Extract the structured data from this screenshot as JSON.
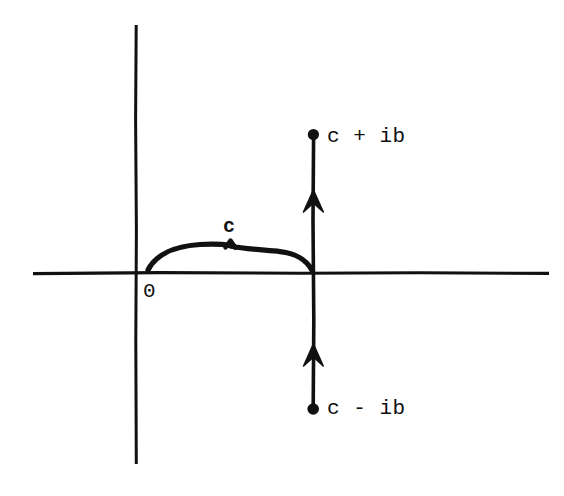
{
  "figure": {
    "kind": "complex-plane-contour-diagram",
    "background_color": "#ffffff",
    "ink_color": "#111111",
    "width": 564,
    "height": 496
  },
  "axes": {
    "real_axis": {
      "name": "horizontal-axis",
      "x_start": 33,
      "x_end": 549,
      "y": 273
    },
    "imaginary_axis": {
      "name": "vertical-axis",
      "x": 136,
      "y_start": 25,
      "y_end": 464
    },
    "origin": {
      "x": 136,
      "y": 273
    }
  },
  "labels": {
    "origin": "0",
    "offset": "c",
    "upper_endpoint": "c + ib",
    "lower_endpoint": "c - ib"
  },
  "contour": {
    "name": "bromwich-contour",
    "x": 314,
    "y_top": 135,
    "y_bottom": 408,
    "direction": "upward",
    "arrow_positions": [
      204,
      358
    ],
    "endpoints": [
      {
        "label": "c + ib",
        "x": 313,
        "y": 134
      },
      {
        "label": "c - ib",
        "x": 313,
        "y": 409
      }
    ]
  },
  "brace": {
    "name": "offset-brace",
    "x_start": 148,
    "x_end": 313,
    "y_base": 270,
    "y_peak": 244,
    "tip_x": 230,
    "label": "c"
  }
}
